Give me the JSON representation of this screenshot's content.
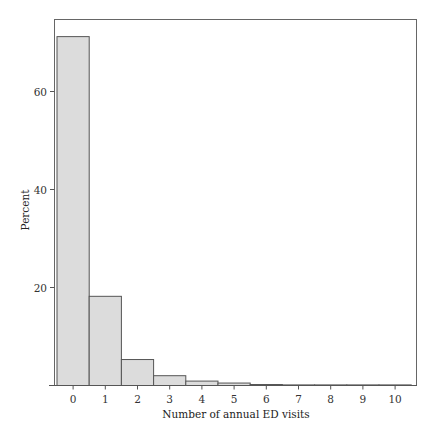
{
  "chart_data": {
    "type": "bar",
    "title": "",
    "xlabel": "Number of annual ED visits",
    "ylabel": "Percent",
    "categories": [
      "0",
      "1",
      "2",
      "3",
      "4",
      "5",
      "6",
      "7",
      "8",
      "9",
      "10"
    ],
    "values": [
      71.2,
      18.2,
      5.3,
      2.0,
      0.9,
      0.5,
      0.2,
      0.1,
      0.05,
      0.02,
      0.02
    ],
    "ylim": [
      0,
      75
    ],
    "yticks": [
      20,
      40,
      60
    ],
    "xticks": [
      0,
      1,
      2,
      3,
      4,
      5,
      6,
      7,
      8,
      9,
      10
    ],
    "grid": false,
    "legend": null,
    "bar_fill": "#dcdcdc",
    "bar_stroke": "#555555"
  }
}
